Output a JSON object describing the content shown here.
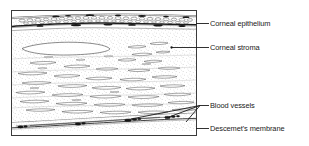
{
  "figure": {
    "type": "histology-diagram",
    "frame": {
      "x": 11,
      "y": 10,
      "width": 186,
      "height": 126
    },
    "ink_color": "#1a1a1a",
    "background_color": "#ffffff",
    "stipple_color": "#8a8a8a",
    "labels": [
      {
        "id": "corneal-epithelium",
        "text": "Corneal epithelium",
        "leader": {
          "from_x": 197,
          "from_y": 24,
          "to_x": 208,
          "to_y": 24
        },
        "anchor": {
          "x": 197,
          "y": 24
        }
      },
      {
        "id": "corneal-stroma",
        "text": "Corneal stroma",
        "leader": {
          "from_x": 171,
          "from_y": 48,
          "to_x": 208,
          "to_y": 48
        },
        "anchor": {
          "x": 171,
          "y": 48
        }
      },
      {
        "id": "blood-vessels",
        "text": "Blood vessels",
        "leader": {
          "from_x": 200,
          "from_y": 106,
          "to_x": 208,
          "to_y": 106
        },
        "anchor": {
          "x": 200,
          "y": 106
        }
      },
      {
        "id": "descemets-membrane",
        "text": "Descemet's membrane",
        "leader": {
          "from_x": 195,
          "from_y": 129,
          "to_x": 208,
          "to_y": 129
        },
        "anchor": {
          "x": 195,
          "y": 129
        }
      }
    ]
  }
}
